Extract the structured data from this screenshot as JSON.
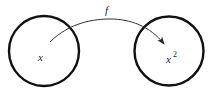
{
  "diagram": {
    "domain_set": {
      "shape": "circle",
      "label": "x",
      "cx": 44,
      "cy": 51,
      "r": 36
    },
    "codomain_set": {
      "shape": "circle",
      "label_base": "x",
      "label_exponent": "2",
      "cx": 169,
      "cy": 51,
      "r": 35
    },
    "mapping_arrow": {
      "label": "f",
      "from": "x",
      "to": "x^2"
    },
    "colors": {
      "stroke": "#111111",
      "arrow": "#333333",
      "text": "#222222",
      "background": "#ffffff"
    }
  }
}
